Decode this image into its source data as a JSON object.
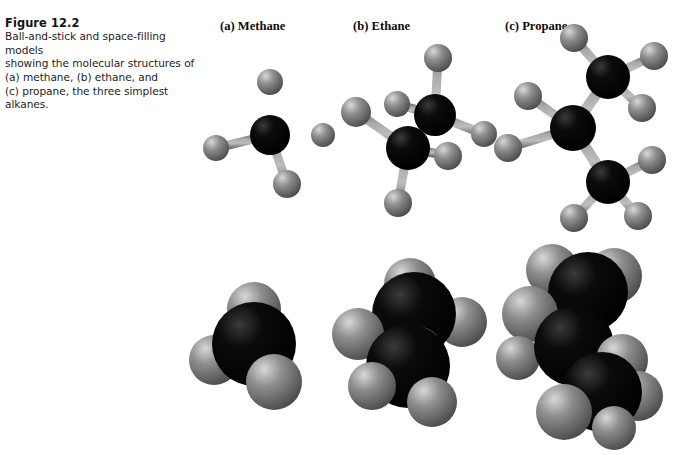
{
  "figure": {
    "number": "Figure 12.2",
    "caption": "Ball-and-stick and space-filling models\nshowing the molecular structures of\n(a) methane, (b) ethane, and\n(c) propane, the three simplest\nalkanes."
  },
  "columns": [
    {
      "id": "methane",
      "heading": "(a) Methane"
    },
    {
      "id": "ethane",
      "heading": "(b) Ethane"
    },
    {
      "id": "propane",
      "heading": "(c) Propane"
    }
  ],
  "colors": {
    "background": "#ffffff",
    "carbon": "#0b0b0b",
    "carbon_highlight": "#3a3a3a",
    "hydrogen": "#8e8e8e",
    "hydrogen_highlight": "#d8d8d8",
    "hydrogen_shadow": "#4a4a4a",
    "bond": "#a8a8a8",
    "bond_shadow": "#6e6e6e",
    "text": "#1a1a1a"
  },
  "models": {
    "row_ball_and_stick_label": "ball-and-stick",
    "row_space_filling_label": "space-filling",
    "methane": {
      "formula": "CH4",
      "carbon_count": 1,
      "hydrogen_count": 4,
      "ball_and_stick": {
        "carbons": [
          {
            "x": 84,
            "y": 75,
            "r": 20
          }
        ],
        "hydrogens": [
          {
            "x": 84,
            "y": 22,
            "r": 13
          },
          {
            "x": 30,
            "y": 88,
            "r": 13
          },
          {
            "x": 137,
            "y": 75,
            "r": 12
          },
          {
            "x": 101,
            "y": 124,
            "r": 14
          }
        ]
      },
      "space_filling": {
        "carbons": [
          {
            "x": 68,
            "y": 62,
            "r": 42
          }
        ],
        "hydrogens": [
          {
            "x": 68,
            "y": 27,
            "r": 27
          },
          {
            "x": 28,
            "y": 78,
            "r": 25
          },
          {
            "x": 88,
            "y": 100,
            "r": 28
          }
        ]
      }
    },
    "ethane": {
      "formula": "C2H6",
      "carbon_count": 2,
      "hydrogen_count": 6,
      "ball_and_stick": {
        "carbons": [
          {
            "x": 109,
            "y": 73,
            "r": 21
          },
          {
            "x": 82,
            "y": 106,
            "r": 22
          }
        ],
        "hydrogens": [
          {
            "x": 112,
            "y": 16,
            "r": 14
          },
          {
            "x": 158,
            "y": 92,
            "r": 13
          },
          {
            "x": 71,
            "y": 62,
            "r": 13
          },
          {
            "x": 30,
            "y": 70,
            "r": 15
          },
          {
            "x": 122,
            "y": 114,
            "r": 14
          },
          {
            "x": 72,
            "y": 161,
            "r": 14
          }
        ]
      },
      "space_filling": {
        "carbons": [
          {
            "x": 78,
            "y": 52,
            "r": 42
          },
          {
            "x": 72,
            "y": 104,
            "r": 42
          }
        ],
        "hydrogens": [
          {
            "x": 74,
            "y": 22,
            "r": 26
          },
          {
            "x": 126,
            "y": 60,
            "r": 25
          },
          {
            "x": 22,
            "y": 72,
            "r": 26
          },
          {
            "x": 80,
            "y": 92,
            "r": 28
          },
          {
            "x": 36,
            "y": 124,
            "r": 24
          },
          {
            "x": 96,
            "y": 140,
            "r": 25
          }
        ]
      }
    },
    "propane": {
      "formula": "C3H8",
      "carbon_count": 3,
      "hydrogen_count": 8,
      "ball_and_stick": {
        "carbons": [
          {
            "x": 122,
            "y": 51,
            "r": 22
          },
          {
            "x": 87,
            "y": 102,
            "r": 23
          },
          {
            "x": 122,
            "y": 156,
            "r": 22
          }
        ],
        "hydrogens": [
          {
            "x": 88,
            "y": 12,
            "r": 14
          },
          {
            "x": 168,
            "y": 30,
            "r": 14
          },
          {
            "x": 156,
            "y": 82,
            "r": 14
          },
          {
            "x": 42,
            "y": 70,
            "r": 14
          },
          {
            "x": 22,
            "y": 122,
            "r": 14
          },
          {
            "x": 166,
            "y": 134,
            "r": 14
          },
          {
            "x": 152,
            "y": 190,
            "r": 14
          },
          {
            "x": 88,
            "y": 192,
            "r": 14
          }
        ]
      },
      "space_filling": {
        "carbons": [
          {
            "x": 92,
            "y": 46,
            "r": 40
          },
          {
            "x": 78,
            "y": 100,
            "r": 40
          },
          {
            "x": 106,
            "y": 146,
            "r": 40
          }
        ],
        "hydrogens": [
          {
            "x": 56,
            "y": 24,
            "r": 26
          },
          {
            "x": 118,
            "y": 30,
            "r": 28
          },
          {
            "x": 34,
            "y": 68,
            "r": 28
          },
          {
            "x": 22,
            "y": 112,
            "r": 22
          },
          {
            "x": 126,
            "y": 114,
            "r": 26
          },
          {
            "x": 142,
            "y": 150,
            "r": 25
          },
          {
            "x": 68,
            "y": 166,
            "r": 28
          },
          {
            "x": 118,
            "y": 182,
            "r": 22
          }
        ]
      }
    }
  }
}
